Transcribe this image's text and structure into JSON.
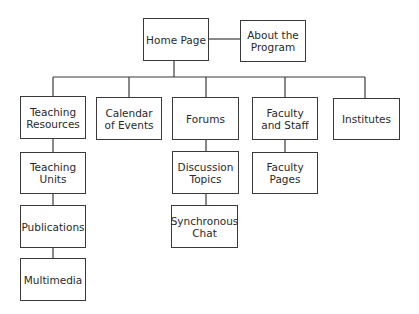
{
  "diagram": {
    "type": "site-map hierarchy",
    "colors": {
      "line": "#3a3a3a",
      "text": "#2a2a2a",
      "background": "#ffffff"
    },
    "nodes": {
      "home": {
        "label": "Home Page",
        "x": 143,
        "y": 18,
        "w": 66,
        "h": 43
      },
      "about": {
        "label": "About the Program",
        "x": 240,
        "y": 20,
        "w": 66,
        "h": 42
      },
      "teaching_resources": {
        "label": "Teaching Resources",
        "x": 20,
        "y": 96,
        "w": 66,
        "h": 43
      },
      "calendar": {
        "label": "Calendar of Events",
        "x": 96,
        "y": 97,
        "w": 66,
        "h": 43
      },
      "forums": {
        "label": "Forums",
        "x": 172,
        "y": 97,
        "w": 67,
        "h": 43
      },
      "faculty_staff": {
        "label": "Faculty and Staff",
        "x": 252,
        "y": 97,
        "w": 66,
        "h": 43
      },
      "institutes": {
        "label": "Institutes",
        "x": 333,
        "y": 98,
        "w": 67,
        "h": 42
      },
      "teaching_units": {
        "label": "Teaching Units",
        "x": 20,
        "y": 152,
        "w": 66,
        "h": 42
      },
      "publications": {
        "label": "Publications",
        "x": 20,
        "y": 205,
        "w": 66,
        "h": 43
      },
      "multimedia": {
        "label": "Multimedia",
        "x": 20,
        "y": 258,
        "w": 66,
        "h": 43
      },
      "discussion_topics": {
        "label": "Discussion Topics",
        "x": 172,
        "y": 151,
        "w": 67,
        "h": 43
      },
      "synchronous_chat": {
        "label": "Synchronous Chat",
        "x": 171,
        "y": 205,
        "w": 67,
        "h": 43
      },
      "faculty_pages": {
        "label": "Faculty Pages",
        "x": 252,
        "y": 152,
        "w": 66,
        "h": 42
      }
    },
    "edges": [
      [
        "Home Page",
        "About the Program"
      ],
      [
        "Home Page",
        "Teaching Resources"
      ],
      [
        "Home Page",
        "Calendar of Events"
      ],
      [
        "Home Page",
        "Forums"
      ],
      [
        "Home Page",
        "Faculty and Staff"
      ],
      [
        "Home Page",
        "Institutes"
      ],
      [
        "Teaching Resources",
        "Teaching Units"
      ],
      [
        "Teaching Units",
        "Publications"
      ],
      [
        "Publications",
        "Multimedia"
      ],
      [
        "Forums",
        "Discussion Topics"
      ],
      [
        "Discussion Topics",
        "Synchronous Chat"
      ],
      [
        "Faculty and Staff",
        "Faculty Pages"
      ]
    ]
  }
}
